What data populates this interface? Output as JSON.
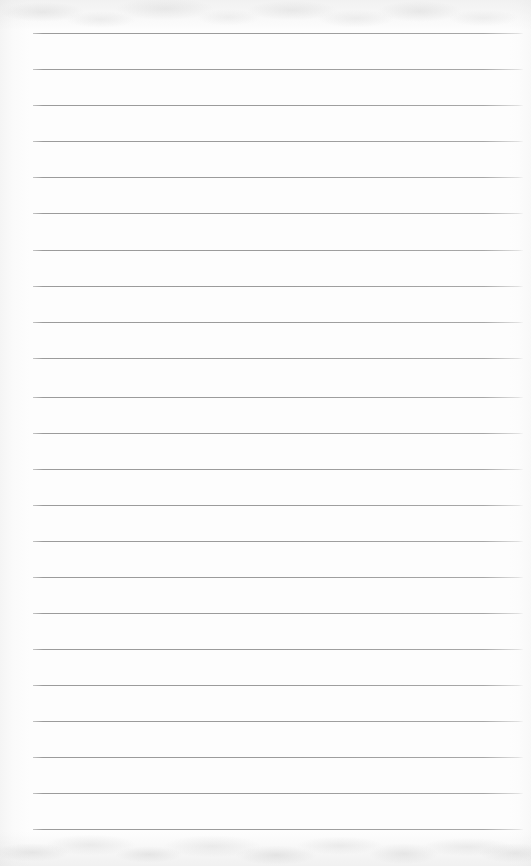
{
  "document": {
    "kind": "scanned-blank-ruled-notebook-page",
    "page_width": 531,
    "page_height": 866,
    "paper_color": "#fdfdfd",
    "content_text": "",
    "handwriting_present": false,
    "printed_text_present": false
  },
  "ruling": {
    "line_count": 23,
    "first_line_y": 33,
    "line_spacing": 36.1,
    "line_left_x": 33,
    "line_right_x": 523,
    "line_thickness": 1,
    "line_color": "#9b9b9b",
    "left_margin_width": 33,
    "right_margin_width": 8,
    "vertical_margin_rule_present": false,
    "line_y_positions": [
      33,
      69,
      105,
      141,
      177,
      213,
      250,
      286,
      322,
      358,
      397,
      433,
      469,
      505,
      541,
      577,
      613,
      649,
      685,
      721,
      757,
      793,
      829
    ]
  },
  "scan_artifacts": {
    "top_band_height": 30,
    "bottom_band_height": 34,
    "left_edge_gradient_width": 30,
    "right_edge_gradient_width": 22,
    "artifact_tone": "#b4b4b4",
    "description": "faint gray mottling along top and bottom edges from scanning"
  }
}
